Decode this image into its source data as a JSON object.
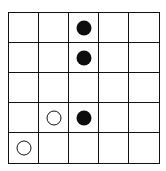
{
  "board": {
    "rows": 5,
    "cols": 5,
    "line_color": "#111111",
    "pieces": [
      {
        "row": 0,
        "col": 2,
        "color": "black"
      },
      {
        "row": 1,
        "col": 2,
        "color": "black"
      },
      {
        "row": 3,
        "col": 1,
        "color": "white"
      },
      {
        "row": 3,
        "col": 2,
        "color": "black"
      },
      {
        "row": 4,
        "col": 0,
        "color": "white"
      }
    ]
  }
}
